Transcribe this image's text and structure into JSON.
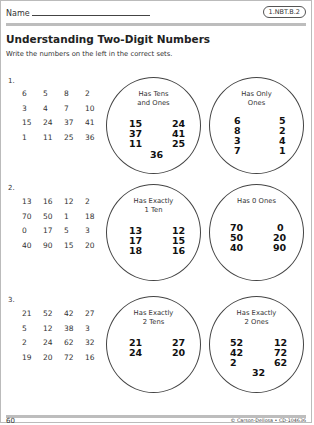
{
  "header": {
    "name_label": "Name",
    "standard_badge": "1.NBT.B.2",
    "title": "Understanding Two-Digit Numbers",
    "instructions": "Write the numbers on the left in the correct sets."
  },
  "problems": [
    {
      "number": "1.",
      "grid": [
        [
          "6",
          "5",
          "8",
          "2"
        ],
        [
          "3",
          "4",
          "7",
          "10"
        ],
        [
          "15",
          "24",
          "37",
          "41"
        ],
        [
          "1",
          "11",
          "25",
          "36"
        ]
      ],
      "sets": [
        {
          "label_line1": "Has Tens",
          "label_line2": "and Ones",
          "numbers": [
            "15",
            "37",
            "11",
            "24",
            "41",
            "25",
            "36"
          ]
        },
        {
          "label_line1": "Has Only",
          "label_line2": "Ones",
          "numbers": [
            "6",
            "8",
            "3",
            "7",
            "5",
            "2",
            "4",
            "1"
          ]
        }
      ]
    },
    {
      "number": "2.",
      "grid": [
        [
          "13",
          "16",
          "12",
          "2"
        ],
        [
          "70",
          "50",
          "1",
          "18"
        ],
        [
          "0",
          "17",
          "5",
          "3"
        ],
        [
          "40",
          "90",
          "15",
          "20"
        ]
      ],
      "sets": [
        {
          "label_line1": "Has Exactly",
          "label_line2": "1 Ten",
          "numbers": [
            "13",
            "17",
            "18",
            "12",
            "15",
            "16"
          ]
        },
        {
          "label_line1": "Has 0 Ones",
          "label_line2": "",
          "numbers": [
            "70",
            "50",
            "40",
            "0",
            "20",
            "90"
          ]
        }
      ]
    },
    {
      "number": "3.",
      "grid": [
        [
          "21",
          "52",
          "42",
          "27"
        ],
        [
          "5",
          "12",
          "38",
          "3"
        ],
        [
          "2",
          "24",
          "62",
          "32"
        ],
        [
          "19",
          "20",
          "72",
          "16"
        ]
      ],
      "sets": [
        {
          "label_line1": "Has Exactly",
          "label_line2": "2 Tens",
          "numbers": [
            "21",
            "24",
            "27",
            "20"
          ]
        },
        {
          "label_line1": "Has Exactly",
          "label_line2": "2 Ones",
          "numbers": [
            "52",
            "42",
            "2",
            "12",
            "72",
            "62",
            "32"
          ]
        }
      ]
    }
  ],
  "footer": {
    "page_number": "60",
    "copyright": "© Carson-Dellosa • CD-104636"
  }
}
